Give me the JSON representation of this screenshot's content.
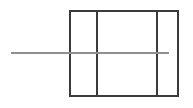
{
  "figure": {
    "title": "",
    "background_color": "#ffffff",
    "width": 193,
    "height": 108
  },
  "shapes": {
    "rectangle": {
      "name": "outer-rectangle",
      "x": 69,
      "y": 10,
      "width": 110,
      "height": 87,
      "stroke_color": "#3b3b3b",
      "stroke_width": 2,
      "fill": "none"
    },
    "dividers": [
      {
        "name": "vertical-divider-left",
        "x": 97,
        "y1": 10,
        "y2": 97,
        "stroke_color": "#3b3b3b",
        "stroke_width": 2
      },
      {
        "name": "vertical-divider-right",
        "x": 157,
        "y1": 10,
        "y2": 97,
        "stroke_color": "#3b3b3b",
        "stroke_width": 2
      }
    ],
    "axis_line": {
      "name": "horizontal-axis-line",
      "x1": 11,
      "x2": 169,
      "y": 53,
      "stroke_color": "#8f8f8f",
      "stroke_width": 2
    }
  },
  "panels": [
    {
      "label": "",
      "index": 1
    },
    {
      "label": "",
      "index": 2
    },
    {
      "label": "",
      "index": 3
    }
  ]
}
